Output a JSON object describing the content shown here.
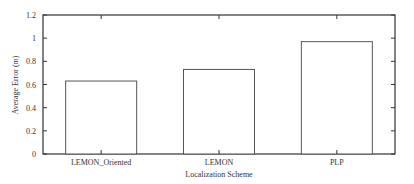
{
  "chart_data": {
    "type": "bar",
    "title": "",
    "xlabel": "Localization Scheme",
    "ylabel": "Average Error (m)",
    "categories": [
      "LEMON_Oriented",
      "LEMON",
      "PLP"
    ],
    "values": [
      0.63,
      0.73,
      0.97
    ],
    "ylim": [
      0,
      1.2
    ],
    "yticks": [
      "0",
      "0.2",
      "0.4",
      "0.6",
      "0.8",
      "1",
      "1.2"
    ],
    "grid": false,
    "legend": null,
    "bar_fill": "#ffffff",
    "bar_stroke": "#555555"
  }
}
